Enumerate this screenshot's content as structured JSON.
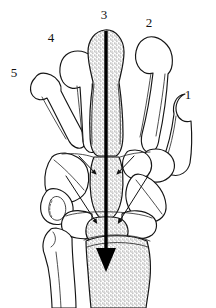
{
  "figure": {
    "name": "hand-wrist-skeleton-dorsal-view",
    "background_color": "#ffffff",
    "line_color": "#151515",
    "shade_color": "#d9d9d9",
    "arrow_color": "#000000"
  },
  "labels": {
    "digit_1": "1",
    "digit_2": "2",
    "digit_3": "3",
    "digit_4": "4",
    "digit_5": "5"
  },
  "label_positions": {
    "digit_1": {
      "x": 188,
      "y": 99
    },
    "digit_2": {
      "x": 149,
      "y": 27
    },
    "digit_3": {
      "x": 104,
      "y": 19
    },
    "digit_4": {
      "x": 51,
      "y": 42
    },
    "digit_5": {
      "x": 14,
      "y": 77
    }
  },
  "annotations": {
    "main_axis": {
      "name": "central-longitudinal-axis-arrow",
      "direction": "downward",
      "from": {
        "x": 106,
        "y": 30
      },
      "to": {
        "x": 106,
        "y": 272
      }
    },
    "joint_arrows": [
      {
        "name": "carpometacarpal-arrow-left",
        "from": {
          "x": 79,
          "y": 156
        },
        "to": {
          "x": 95,
          "y": 175
        }
      },
      {
        "name": "carpometacarpal-arrow-right",
        "from": {
          "x": 134,
          "y": 156
        },
        "to": {
          "x": 118,
          "y": 175
        }
      },
      {
        "name": "midcarpal-arrow-left",
        "from": {
          "x": 66,
          "y": 176
        },
        "to": {
          "x": 96,
          "y": 224
        }
      },
      {
        "name": "midcarpal-arrow-right",
        "from": {
          "x": 148,
          "y": 176
        },
        "to": {
          "x": 119,
          "y": 224
        }
      }
    ]
  },
  "shaded_structures": [
    "third-metacarpal",
    "capitate",
    "lunate",
    "distal-radius"
  ],
  "unshaded_structures": [
    "first-metacarpal",
    "second-metacarpal",
    "fourth-metacarpal",
    "fifth-metacarpal",
    "trapezium",
    "trapezoid",
    "hamate",
    "triquetrum",
    "pisiform",
    "scaphoid",
    "distal-ulna"
  ]
}
